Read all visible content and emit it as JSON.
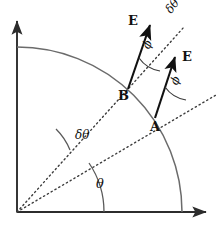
{
  "figure": {
    "title": "",
    "background_color": "#ffffff",
    "stroke_color": "#4a4a4a",
    "axis_color": "#3a3a3a",
    "text_color": "#111111",
    "width": 222,
    "height": 228
  },
  "geometry": {
    "origin": {
      "x": 17,
      "y": 212
    },
    "arc_radius": 165,
    "arc_start_angle_deg": 0,
    "arc_end_angle_deg": 90,
    "theta_deg": 33,
    "theta_plus_delta_deg": 52,
    "point_A": {
      "x": 155,
      "y": 118
    },
    "point_B": {
      "x": 128,
      "y": 89
    },
    "arrow_A_tip": {
      "x": 177,
      "y": 53
    },
    "arrow_B_tip": {
      "x": 152,
      "y": 21
    },
    "dotted_lower_end": {
      "x": 216,
      "y": 95
    },
    "dotted_upper_end": {
      "x": 184,
      "y": 27
    },
    "x_axis_end": {
      "x": 212,
      "y": 212
    },
    "y_axis_end": {
      "x": 17,
      "y": 17
    }
  },
  "labels": {
    "field_vector_upper": "E",
    "field_vector_lower": "E",
    "angle_phi_upper": "ϕ",
    "angle_phi_lower": "ϕ",
    "delta_theta_top": "δθ",
    "delta_theta_middle": "δθ",
    "theta": "θ",
    "point_b": "B",
    "point_a": "A"
  },
  "elements": {
    "y_axis": "vertical-axis-with-arrow",
    "x_axis": "horizontal-axis-with-arrow",
    "quarter_arc": "quarter-circle-arc",
    "radial_line_lower": "dotted-radial-line-theta",
    "radial_line_upper": "dotted-radial-line-theta-plus-delta-theta",
    "theta_arc": "theta-angle-arc",
    "delta_theta_arc": "delta-theta-angle-arc",
    "phi_arc_a": "phi-angle-arc-at-A",
    "phi_arc_b": "phi-angle-arc-at-B"
  }
}
